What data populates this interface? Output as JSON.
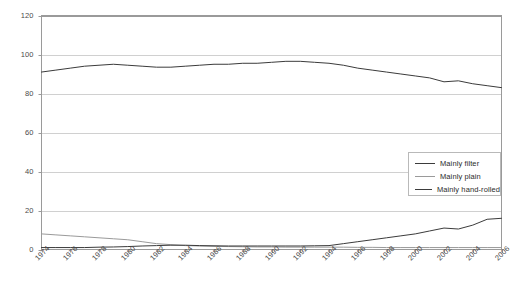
{
  "chart_data": {
    "type": "line",
    "title": "",
    "subtitle": "",
    "xlabel": "",
    "ylabel": "",
    "xlim": [
      1974,
      2006
    ],
    "ylim": [
      0,
      120
    ],
    "yticks": [
      0,
      20,
      40,
      60,
      80,
      100,
      120
    ],
    "xticks": [
      1974,
      1976,
      1978,
      1980,
      1982,
      1984,
      1986,
      1988,
      1990,
      1992,
      1994,
      1996,
      1998,
      2000,
      2002,
      2004,
      2006
    ],
    "grid": "horizontal",
    "legend_position": "center-right",
    "x": [
      1974,
      1975,
      1976,
      1977,
      1978,
      1979,
      1980,
      1981,
      1982,
      1983,
      1984,
      1985,
      1986,
      1987,
      1988,
      1989,
      1990,
      1991,
      1992,
      1993,
      1994,
      1995,
      1996,
      1997,
      1998,
      1999,
      2000,
      2001,
      2002,
      2003,
      2004,
      2005,
      2006
    ],
    "series": [
      {
        "name": "Mainly filter",
        "color": "#3b3b3b",
        "values": [
          91,
          92,
          93,
          94,
          94.5,
          95,
          94.5,
          94,
          93.5,
          93.5,
          94,
          94.5,
          95,
          95,
          95.5,
          95.5,
          96,
          96.5,
          96.5,
          96,
          95.5,
          94.5,
          93,
          92,
          91,
          90,
          89,
          88,
          86,
          86.5,
          85,
          84,
          83
        ]
      },
      {
        "name": "Mainly plain",
        "color": "#9a9a9a",
        "values": [
          8,
          7.5,
          7,
          6.5,
          6,
          5.5,
          5,
          4,
          3,
          2.5,
          2,
          1.8,
          1.6,
          1.5,
          1.4,
          1.3,
          1.3,
          1.2,
          1.2,
          1.2,
          1.2,
          1.2,
          1.1,
          1.1,
          1,
          1,
          1,
          1,
          1,
          1,
          1,
          1,
          1
        ]
      },
      {
        "name": "Mainly hand-rolled",
        "color": "#3b3b3b",
        "values": [
          1,
          1,
          1,
          1,
          1.2,
          1.3,
          1.5,
          1.8,
          2,
          2.2,
          2.2,
          2,
          1.9,
          1.8,
          1.8,
          1.8,
          1.8,
          1.8,
          1.8,
          1.9,
          2,
          3,
          4,
          5,
          6,
          7,
          8,
          9.5,
          11,
          10.5,
          12.5,
          15.5,
          16
        ]
      }
    ]
  },
  "axis": {
    "y_tick_labels": [
      "0",
      "20",
      "40",
      "60",
      "80",
      "100",
      "120"
    ],
    "x_tick_labels": [
      "1974",
      "1976",
      "1978",
      "1980",
      "1982",
      "1984",
      "1986",
      "1988",
      "1990",
      "1992",
      "1994",
      "1996",
      "1998",
      "2000",
      "2002",
      "2004",
      "2006"
    ]
  },
  "legend": {
    "items": [
      {
        "label": "Mainly filter",
        "color": "#3b3b3b"
      },
      {
        "label": "Mainly plain",
        "color": "#9a9a9a"
      },
      {
        "label": "Mainly hand-rolled",
        "color": "#3b3b3b"
      }
    ]
  },
  "colors": {
    "plot_border": "#9a9a9a",
    "gridline": "#d0d0d0",
    "axis_text": "#4a4a4a",
    "background": "#ffffff"
  }
}
